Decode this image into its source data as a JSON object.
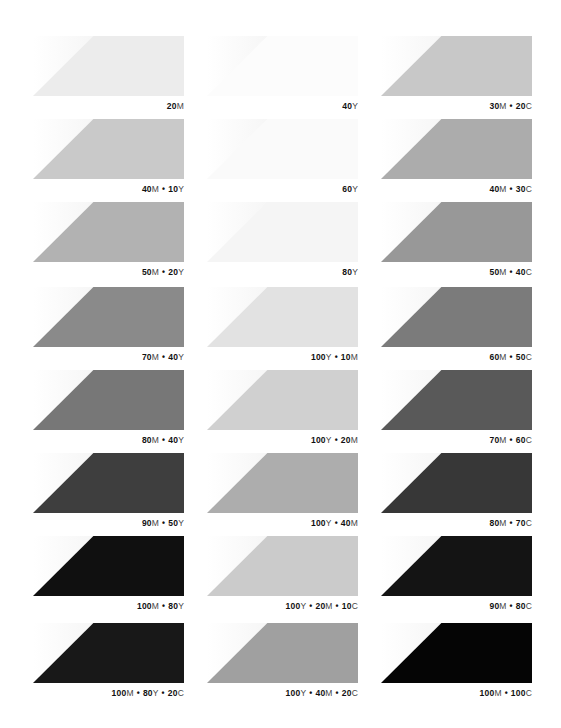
{
  "columns": [
    {
      "x": 33,
      "swatches": [
        {
          "label": "20M",
          "parts": [
            {
              "n": "20",
              "c": "M"
            }
          ],
          "color": "#ececec"
        },
        {
          "label": "40M • 10Y",
          "parts": [
            {
              "n": "40",
              "c": "M"
            },
            {
              "n": "10",
              "c": "Y"
            }
          ],
          "color": "#c9c9c9"
        },
        {
          "label": "50M • 20Y",
          "parts": [
            {
              "n": "50",
              "c": "M"
            },
            {
              "n": "20",
              "c": "Y"
            }
          ],
          "color": "#b2b2b2"
        },
        {
          "label": "70M • 40Y",
          "parts": [
            {
              "n": "70",
              "c": "M"
            },
            {
              "n": "40",
              "c": "Y"
            }
          ],
          "color": "#8a8a8a"
        },
        {
          "label": "80M • 40Y",
          "parts": [
            {
              "n": "80",
              "c": "M"
            },
            {
              "n": "40",
              "c": "Y"
            }
          ],
          "color": "#777777"
        },
        {
          "label": "90M • 50Y",
          "parts": [
            {
              "n": "90",
              "c": "M"
            },
            {
              "n": "50",
              "c": "Y"
            }
          ],
          "color": "#3e3e3e"
        },
        {
          "label": "100M • 80Y",
          "parts": [
            {
              "n": "100",
              "c": "M"
            },
            {
              "n": "80",
              "c": "Y"
            }
          ],
          "color": "#101010"
        },
        {
          "label": "100M • 80Y • 20C",
          "parts": [
            {
              "n": "100",
              "c": "M"
            },
            {
              "n": "80",
              "c": "Y"
            },
            {
              "n": "20",
              "c": "C"
            }
          ],
          "color": "#181818"
        }
      ]
    },
    {
      "x": 207,
      "swatches": [
        {
          "label": "40Y",
          "parts": [
            {
              "n": "40",
              "c": "Y"
            }
          ],
          "color": "#fcfcfc"
        },
        {
          "label": "60Y",
          "parts": [
            {
              "n": "60",
              "c": "Y"
            }
          ],
          "color": "#fafafa"
        },
        {
          "label": "80Y",
          "parts": [
            {
              "n": "80",
              "c": "Y"
            }
          ],
          "color": "#f5f5f5"
        },
        {
          "label": "100Y • 10M",
          "parts": [
            {
              "n": "100",
              "c": "Y"
            },
            {
              "n": "10",
              "c": "M"
            }
          ],
          "color": "#e2e2e2"
        },
        {
          "label": "100Y • 20M",
          "parts": [
            {
              "n": "100",
              "c": "Y"
            },
            {
              "n": "20",
              "c": "M"
            }
          ],
          "color": "#d0d0d0"
        },
        {
          "label": "100Y • 40M",
          "parts": [
            {
              "n": "100",
              "c": "Y"
            },
            {
              "n": "40",
              "c": "M"
            }
          ],
          "color": "#adadad"
        },
        {
          "label": "100Y • 20M • 10C",
          "parts": [
            {
              "n": "100",
              "c": "Y"
            },
            {
              "n": "20",
              "c": "M"
            },
            {
              "n": "10",
              "c": "C"
            }
          ],
          "color": "#cbcbcb"
        },
        {
          "label": "100Y • 40M • 20C",
          "parts": [
            {
              "n": "100",
              "c": "Y"
            },
            {
              "n": "40",
              "c": "M"
            },
            {
              "n": "20",
              "c": "C"
            }
          ],
          "color": "#a0a0a0"
        }
      ]
    },
    {
      "x": 381,
      "swatches": [
        {
          "label": "30M • 20C",
          "parts": [
            {
              "n": "30",
              "c": "M"
            },
            {
              "n": "20",
              "c": "C"
            }
          ],
          "color": "#c8c8c8"
        },
        {
          "label": "40M • 30C",
          "parts": [
            {
              "n": "40",
              "c": "M"
            },
            {
              "n": "30",
              "c": "C"
            }
          ],
          "color": "#acacac"
        },
        {
          "label": "50M • 40C",
          "parts": [
            {
              "n": "50",
              "c": "M"
            },
            {
              "n": "40",
              "c": "C"
            }
          ],
          "color": "#989898"
        },
        {
          "label": "60M • 50C",
          "parts": [
            {
              "n": "60",
              "c": "M"
            },
            {
              "n": "50",
              "c": "C"
            }
          ],
          "color": "#7b7b7b"
        },
        {
          "label": "70M • 60C",
          "parts": [
            {
              "n": "70",
              "c": "M"
            },
            {
              "n": "60",
              "c": "C"
            }
          ],
          "color": "#595959"
        },
        {
          "label": "80M • 70C",
          "parts": [
            {
              "n": "80",
              "c": "M"
            },
            {
              "n": "70",
              "c": "C"
            }
          ],
          "color": "#373737"
        },
        {
          "label": "90M • 80C",
          "parts": [
            {
              "n": "90",
              "c": "M"
            },
            {
              "n": "80",
              "c": "C"
            }
          ],
          "color": "#141414"
        },
        {
          "label": "100M • 100C",
          "parts": [
            {
              "n": "100",
              "c": "M"
            },
            {
              "n": "100",
              "c": "C"
            }
          ],
          "color": "#050505"
        }
      ]
    }
  ],
  "row_tops": [
    36,
    119,
    202,
    287,
    370,
    453,
    536,
    623
  ]
}
